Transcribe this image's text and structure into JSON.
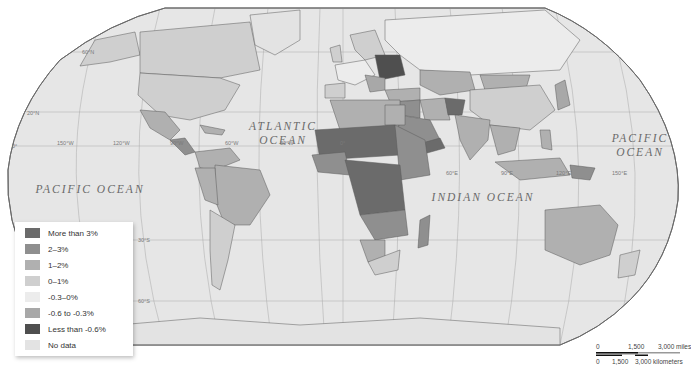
{
  "map": {
    "projection": "Robinson",
    "ocean_labels": [
      {
        "id": "atlantic",
        "lines": [
          "ATLANTIC",
          "OCEAN"
        ]
      },
      {
        "id": "pacific-west",
        "lines": [
          "PACIFIC OCEAN"
        ]
      },
      {
        "id": "pacific-east",
        "lines": [
          "PACIFIC",
          "OCEAN"
        ]
      },
      {
        "id": "indian",
        "lines": [
          "INDIAN OCEAN"
        ]
      }
    ],
    "graticule_labels": {
      "lat_60n": "60°N",
      "lat_20n": "20°N",
      "lat_0": "0°",
      "lat_30s": "30°S",
      "lat_60s": "60°S",
      "lon_150w": "150°W",
      "lon_120w": "120°W",
      "lon_90w": "90°W",
      "lon_60w": "60°W",
      "lon_30w": "30°W",
      "lon_0": "0°",
      "lon_60e": "60°E",
      "lon_90e": "90°E",
      "lon_120e": "120°E",
      "lon_150e": "150°E"
    },
    "colors": {
      "ocean": "#e6e6e6",
      "graticule": "#a9a9a9",
      "border": "#5a5a5a",
      "outline": "#6a6a6a"
    }
  },
  "legend": {
    "items": [
      {
        "label": "More than 3%",
        "color": "#6b6b6b"
      },
      {
        "label": "2–3%",
        "color": "#8f8f8f"
      },
      {
        "label": "1–2%",
        "color": "#b0b0b0"
      },
      {
        "label": "0–1%",
        "color": "#cfcfcf"
      },
      {
        "label": "-0.3–0%",
        "color": "#ececec"
      },
      {
        "label": "-0.6 to -0.3%",
        "color": "#a8a8a8"
      },
      {
        "label": "Less than -0.6%",
        "color": "#4f4f4f"
      },
      {
        "label": "No data",
        "color": "#e3e3e3"
      }
    ]
  },
  "scale": {
    "miles_labels": [
      "0",
      "1,500",
      "3,000 miles"
    ],
    "km_labels": [
      "0",
      "1,500",
      "3,000 kilometers"
    ]
  }
}
